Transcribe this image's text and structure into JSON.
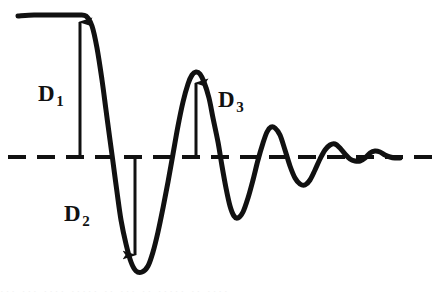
{
  "figure": {
    "name": "damped-oscillation-waveform",
    "background_color": "#ffffff",
    "ink_color": "#111111",
    "baseline": {
      "name": "zero-axis",
      "style": "dashed",
      "y": 157,
      "x_start": 8,
      "x_end": 434,
      "dash_length": 18,
      "dash_gap": 11,
      "thickness": 4
    },
    "annotations": [
      {
        "id": "d1",
        "base": "D",
        "subscript": "1",
        "label": "D1",
        "x": 38,
        "y": 82,
        "direction": "up",
        "arrow_x": 80,
        "arrow_from_y": 157,
        "arrow_to_y": 19
      },
      {
        "id": "d2",
        "base": "D",
        "subscript": "2",
        "label": "D2",
        "x": 64,
        "y": 202,
        "direction": "down",
        "arrow_x": 135,
        "arrow_from_y": 157,
        "arrow_to_y": 258
      },
      {
        "id": "d3",
        "base": "D",
        "subscript": "3",
        "label": "D3",
        "x": 218,
        "y": 88,
        "direction": "up",
        "arrow_x": 196,
        "arrow_from_y": 157,
        "arrow_to_y": 80
      }
    ]
  },
  "chart_data": {
    "type": "line",
    "title": "",
    "xlabel": "",
    "ylabel": "",
    "grid": false,
    "legend": null,
    "xlim": [
      0,
      442
    ],
    "ylim": [
      292,
      0
    ],
    "baseline_y": 157,
    "stroke_width": 5,
    "series": [
      {
        "name": "damped-oscillation",
        "color": "#111111",
        "points": [
          [
            18,
            16
          ],
          [
            34,
            15
          ],
          [
            50,
            15
          ],
          [
            66,
            15
          ],
          [
            78,
            15
          ],
          [
            86,
            16
          ],
          [
            92,
            26
          ],
          [
            97,
            48
          ],
          [
            102,
            80
          ],
          [
            106,
            110
          ],
          [
            110,
            140
          ],
          [
            113,
            162
          ],
          [
            117,
            192
          ],
          [
            121,
            220
          ],
          [
            126,
            244
          ],
          [
            131,
            262
          ],
          [
            136,
            271
          ],
          [
            142,
            272
          ],
          [
            148,
            266
          ],
          [
            153,
            252
          ],
          [
            158,
            232
          ],
          [
            163,
            208
          ],
          [
            168,
            182
          ],
          [
            173,
            154
          ],
          [
            178,
            126
          ],
          [
            183,
            102
          ],
          [
            188,
            84
          ],
          [
            192,
            75
          ],
          [
            196,
            72
          ],
          [
            200,
            74
          ],
          [
            204,
            82
          ],
          [
            209,
            98
          ],
          [
            213,
            118
          ],
          [
            218,
            142
          ],
          [
            222,
            166
          ],
          [
            226,
            188
          ],
          [
            230,
            206
          ],
          [
            234,
            216
          ],
          [
            238,
            218
          ],
          [
            243,
            212
          ],
          [
            248,
            198
          ],
          [
            253,
            180
          ],
          [
            258,
            160
          ],
          [
            263,
            143
          ],
          [
            267,
            132
          ],
          [
            271,
            127
          ],
          [
            275,
            128
          ],
          [
            280,
            135
          ],
          [
            285,
            150
          ],
          [
            290,
            166
          ],
          [
            295,
            178
          ],
          [
            300,
            184
          ],
          [
            305,
            185
          ],
          [
            310,
            180
          ],
          [
            315,
            170
          ],
          [
            320,
            159
          ],
          [
            325,
            150
          ],
          [
            330,
            145
          ],
          [
            335,
            144
          ],
          [
            340,
            148
          ],
          [
            345,
            154
          ],
          [
            350,
            159
          ],
          [
            355,
            161
          ],
          [
            360,
            161
          ],
          [
            365,
            158
          ],
          [
            370,
            153
          ],
          [
            375,
            151
          ],
          [
            380,
            152
          ],
          [
            385,
            155
          ],
          [
            390,
            157
          ],
          [
            395,
            158
          ],
          [
            400,
            158
          ]
        ]
      }
    ]
  },
  "clipped_caption": {
    "text": "··· ··· ···· ····· ·· ··· ·· ····· ·· ····"
  }
}
